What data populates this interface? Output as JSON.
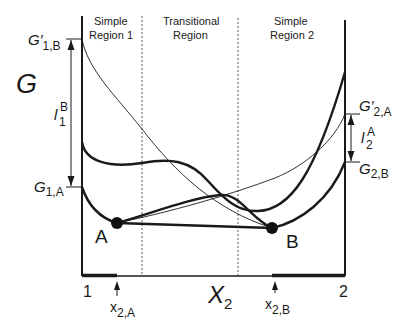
{
  "diagram": {
    "y_axis_label": "G",
    "x_axis_label": {
      "main": "X",
      "sub": "2"
    },
    "x_ticks": [
      "1",
      "2"
    ],
    "regions": [
      {
        "line1": "Simple",
        "line2": "Region 1"
      },
      {
        "line1": "Transitional",
        "line2": "Region"
      },
      {
        "line1": "Simple",
        "line2": "Region 2"
      }
    ],
    "points": [
      {
        "name": "A"
      },
      {
        "name": "B"
      }
    ],
    "left_labels": {
      "g_prime_1B": {
        "main": "G′",
        "sub": "1,B"
      },
      "g_1A": {
        "main": "G",
        "sub": "1,A"
      },
      "l_1B": {
        "main": "l",
        "sub": "1",
        "sup": "B"
      }
    },
    "right_labels": {
      "g_prime_2A": {
        "main": "G′",
        "sub": "2,A"
      },
      "g_2B": {
        "main": "G",
        "sub": "2,B"
      },
      "l_2A": {
        "main": "l",
        "sub": "2",
        "sup": "A"
      }
    },
    "bottom_markers": {
      "x_2A": {
        "main": "x",
        "sub": "2,A"
      },
      "x_2B": {
        "main": "x",
        "sub": "2,B"
      }
    },
    "colors": {
      "ink": "#1a1a1a",
      "background": "#ffffff"
    }
  }
}
